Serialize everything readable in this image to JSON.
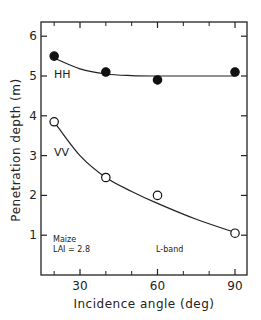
{
  "chart_data": {
    "type": "line",
    "title": "",
    "xlabel": "Incidence  angle  (deg)",
    "ylabel": "Penetration  depth  (m)",
    "xlim": [
      15,
      95
    ],
    "ylim": [
      0,
      6.3
    ],
    "xticks": [
      30,
      60,
      90
    ],
    "xminor": [
      20,
      40,
      50,
      70,
      80
    ],
    "yticks": [
      1,
      2,
      3,
      4,
      5,
      6
    ],
    "grid": false,
    "series": [
      {
        "name": "HH",
        "marker": "filled-circle",
        "x": [
          20,
          40,
          60,
          90
        ],
        "y": [
          5.5,
          5.1,
          4.9,
          5.1
        ],
        "fit": {
          "x": [
            20,
            30,
            40,
            50,
            60,
            75,
            90
          ],
          "y": [
            5.45,
            5.18,
            5.05,
            5.01,
            5.0,
            5.0,
            5.0
          ]
        }
      },
      {
        "name": "VV",
        "marker": "open-circle",
        "x": [
          20,
          40,
          60,
          90
        ],
        "y": [
          3.85,
          2.45,
          2.0,
          1.05
        ],
        "fit": {
          "x": [
            20,
            30,
            40,
            50,
            60,
            75,
            90
          ],
          "y": [
            3.85,
            3.0,
            2.45,
            2.1,
            1.8,
            1.4,
            1.07
          ]
        }
      }
    ],
    "annotations": [
      "Maize",
      "LAI = 2.8",
      "L-band"
    ]
  }
}
